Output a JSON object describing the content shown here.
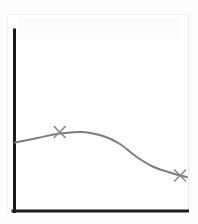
{
  "chart_data": {
    "type": "line",
    "title": "",
    "subtitle": "",
    "xlabel": "",
    "ylabel": "",
    "grid": false,
    "legend": null,
    "legend_position": "none",
    "xlim": [
      0,
      100
    ],
    "ylim": [
      0,
      100
    ],
    "axis_ticks": {
      "x": [],
      "y": []
    },
    "annotations": [],
    "series": [
      {
        "name": "curve",
        "color": "#7d7d7d",
        "line_style": "solid",
        "smoothing": "spline",
        "x": [
          0,
          13,
          26,
          39,
          52,
          61,
          70,
          80,
          90,
          96,
          100
        ],
        "y": [
          45,
          48,
          51,
          52,
          49,
          44,
          36,
          29,
          25,
          23,
          22
        ]
      }
    ],
    "markers": [
      {
        "label": "",
        "glyph": "x",
        "color": "#8a8a8a",
        "x": 26,
        "y": 52
      },
      {
        "label": "",
        "glyph": "x",
        "color": "#8a8a8a",
        "x": 96,
        "y": 23
      }
    ],
    "axes_style": {
      "color": "#1b1b1b",
      "width_px": 3,
      "spines": [
        "left",
        "bottom"
      ]
    },
    "background_color": "#fdfdfd",
    "plot_area_color": "#ffffff"
  }
}
